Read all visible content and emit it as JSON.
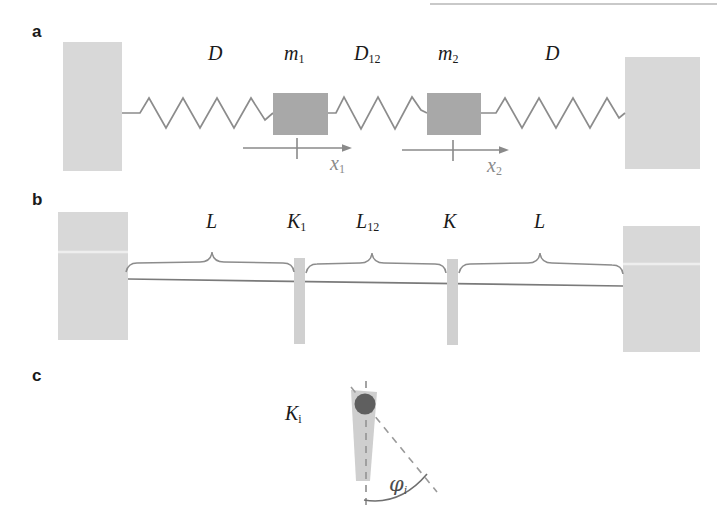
{
  "figure": {
    "type": "schematic-diagram",
    "width": 717,
    "height": 524,
    "background": "#ffffff"
  },
  "colors": {
    "wall_fill": "#d8d8d8",
    "mass_fill": "#a8a8a8",
    "spring_stroke": "#8c8c8c",
    "beam_stroke": "#7a7a7a",
    "brace_stroke": "#8c8c8c",
    "bar_fill": "#d0d0d0",
    "rod_fill": "#cfcfcf",
    "bob_fill": "#5f5f5f",
    "dash_stroke": "#9a9a9a",
    "arrow_stroke": "#8a8a8a",
    "label_color": "#1a1a1a",
    "gray_label_color": "#8a8a8a",
    "phi_color": "#4d4d4d"
  },
  "panels": [
    {
      "id": "a",
      "letter": "a",
      "caption": "two masses coupled by three springs between rigid walls",
      "labels": [
        {
          "name": "spring-left-label",
          "text": "D",
          "sub": "",
          "x": 208,
          "y": 42
        },
        {
          "name": "mass-1-label",
          "text": "m",
          "sub": "1",
          "x": 284,
          "y": 42
        },
        {
          "name": "spring-middle-label",
          "text": "D",
          "sub": "12",
          "x": 354,
          "y": 42
        },
        {
          "name": "mass-2-label",
          "text": "m",
          "sub": "2",
          "x": 438,
          "y": 42
        },
        {
          "name": "spring-right-label",
          "text": "D",
          "sub": "",
          "x": 545,
          "y": 42
        }
      ],
      "displacement_labels": [
        {
          "name": "displacement-x1-label",
          "text": "x",
          "sub": "1",
          "x": 330,
          "y": 155
        },
        {
          "name": "displacement-x2-label",
          "text": "x",
          "sub": "2",
          "x": 487,
          "y": 157
        }
      ]
    },
    {
      "id": "b",
      "letter": "b",
      "caption": "torsional pendulum chain: segments of length L coupled by torsion springs",
      "labels": [
        {
          "name": "length-left-label",
          "text": "L",
          "sub": "",
          "x": 206,
          "y": 212
        },
        {
          "name": "torsion-k1-label",
          "text": "K",
          "sub": "1",
          "x": 287,
          "y": 212
        },
        {
          "name": "length-middle-label",
          "text": "L",
          "sub": "12",
          "x": 356,
          "y": 212
        },
        {
          "name": "torsion-k-label",
          "text": "K",
          "sub": "",
          "x": 443,
          "y": 212
        },
        {
          "name": "length-right-label",
          "text": "L",
          "sub": "",
          "x": 534,
          "y": 212
        }
      ]
    },
    {
      "id": "c",
      "letter": "c",
      "caption": "single torsion element K_i twisted through angle phi_i",
      "labels": [
        {
          "name": "torsion-ki-label",
          "text": "K",
          "sub": "i",
          "x": 285,
          "y": 405
        },
        {
          "name": "angle-phi-label",
          "text": "φ",
          "sub": "i",
          "x": 389,
          "y": 477
        }
      ]
    }
  ]
}
